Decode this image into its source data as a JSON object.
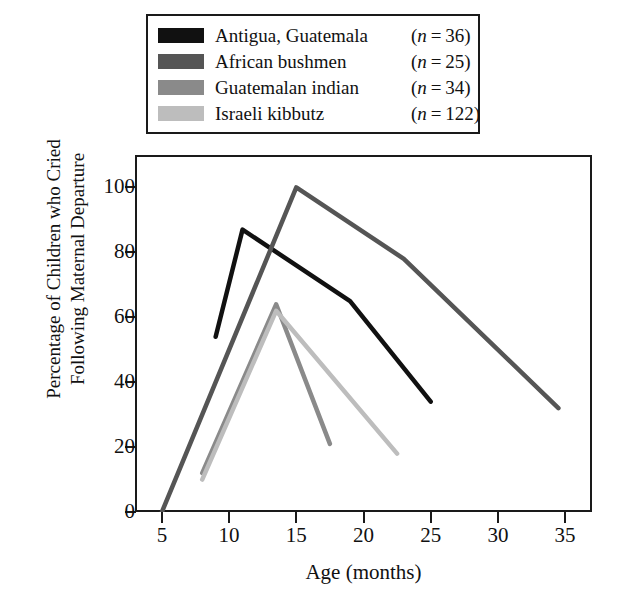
{
  "legend": {
    "entries": [
      {
        "label": "Antigua, Guatemala",
        "n_prefix": "(",
        "n_var": "n",
        "n_eq": "=",
        "n_value": "36",
        "n_suffix": ")",
        "n_text": "(n = 36)",
        "color": "#111111"
      },
      {
        "label": "African bushmen",
        "n_prefix": "(",
        "n_var": "n",
        "n_eq": "=",
        "n_value": "25",
        "n_suffix": ")",
        "n_text": "(n = 25)",
        "color": "#555555"
      },
      {
        "label": "Guatemalan indian",
        "n_prefix": "(",
        "n_var": "n",
        "n_eq": "=",
        "n_value": "34",
        "n_suffix": ")",
        "n_text": "(n = 34)",
        "color": "#8a8a8a"
      },
      {
        "label": "Israeli kibbutz",
        "n_prefix": "(",
        "n_var": "n",
        "n_eq": "=",
        "n_value": "122",
        "n_suffix": ")",
        "n_text": "(n = 122)",
        "color": "#bdbdbd"
      }
    ]
  },
  "axes": {
    "y_title_line1": "Percentage of Children who Cried",
    "y_title_line2": "Following Maternal Departure",
    "x_title": "Age (months)",
    "y_ticks": [
      "0",
      "20",
      "40",
      "60",
      "80",
      "100"
    ],
    "x_ticks": [
      "5",
      "10",
      "15",
      "20",
      "25",
      "30",
      "35"
    ]
  },
  "chart_data": {
    "type": "line",
    "title": "",
    "xlabel": "Age (months)",
    "ylabel": "Percentage of Children who Cried Following Maternal Departure",
    "xlim": [
      3,
      37
    ],
    "ylim": [
      0,
      110
    ],
    "xticks": [
      5,
      10,
      15,
      20,
      25,
      30,
      35
    ],
    "yticks": [
      0,
      20,
      40,
      60,
      80,
      100
    ],
    "grid": false,
    "legend_position": "above-plot",
    "series": [
      {
        "name": "Antigua, Guatemala",
        "n": 36,
        "color": "#111111",
        "x": [
          9,
          11,
          19,
          25
        ],
        "y": [
          54,
          87,
          65,
          34
        ]
      },
      {
        "name": "African bushmen",
        "n": 25,
        "color": "#555555",
        "x": [
          5,
          15,
          23,
          34.5
        ],
        "y": [
          0,
          100,
          78,
          32
        ]
      },
      {
        "name": "Guatemalan indian",
        "n": 34,
        "color": "#8a8a8a",
        "x": [
          8,
          13.5,
          17.5
        ],
        "y": [
          12,
          64,
          21
        ]
      },
      {
        "name": "Israeli kibbutz",
        "n": 122,
        "color": "#bdbdbd",
        "x": [
          8,
          13.5,
          22.5
        ],
        "y": [
          10,
          62,
          18
        ]
      }
    ]
  }
}
